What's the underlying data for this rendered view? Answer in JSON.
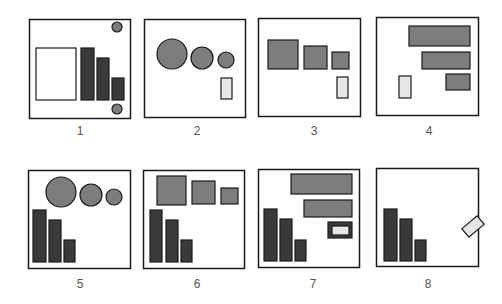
{
  "colors": {
    "stroke": "#1a1a1a",
    "dark": "#3a3a3a",
    "medium": "#7d7d7d",
    "light": "#e6e6e6",
    "white": "#ffffff"
  },
  "panels": [
    {
      "label": "1",
      "x": 29,
      "y": 19,
      "w": 101,
      "h": 99,
      "label_x": 80,
      "label_y": 124,
      "shapes": [
        {
          "type": "rect",
          "name": "white-rect",
          "x": 36,
          "y": 48,
          "w": 40,
          "h": 52,
          "fill": "white"
        },
        {
          "type": "rect",
          "name": "bar-1",
          "x": 81,
          "y": 48,
          "w": 13,
          "h": 52,
          "fill": "dark"
        },
        {
          "type": "rect",
          "name": "bar-2",
          "x": 97,
          "y": 58,
          "w": 12,
          "h": 42,
          "fill": "dark"
        },
        {
          "type": "rect",
          "name": "bar-3",
          "x": 112,
          "y": 78,
          "w": 12,
          "h": 22,
          "fill": "dark"
        },
        {
          "type": "circle",
          "name": "circle-top",
          "cx": 117,
          "cy": 27,
          "r": 5,
          "fill": "medium"
        },
        {
          "type": "circle",
          "name": "circle-bottom",
          "cx": 117,
          "cy": 109,
          "r": 5,
          "fill": "medium"
        }
      ]
    },
    {
      "label": "2",
      "x": 144,
      "y": 19,
      "w": 101,
      "h": 98,
      "label_x": 197,
      "label_y": 124,
      "shapes": [
        {
          "type": "circle",
          "name": "circle-large",
          "cx": 172,
          "cy": 54,
          "r": 15,
          "fill": "medium"
        },
        {
          "type": "circle",
          "name": "circle-medium",
          "cx": 202,
          "cy": 58,
          "r": 11,
          "fill": "medium"
        },
        {
          "type": "circle",
          "name": "circle-small",
          "cx": 226,
          "cy": 60,
          "r": 8,
          "fill": "medium"
        },
        {
          "type": "rect",
          "name": "light-rect",
          "x": 221,
          "y": 78,
          "w": 11,
          "h": 21,
          "fill": "light"
        }
      ]
    },
    {
      "label": "3",
      "x": 258,
      "y": 18,
      "w": 102,
      "h": 98,
      "label_x": 314,
      "label_y": 124,
      "shapes": [
        {
          "type": "rect",
          "name": "square-large",
          "x": 268,
          "y": 40,
          "w": 30,
          "h": 29,
          "fill": "medium"
        },
        {
          "type": "rect",
          "name": "square-medium",
          "x": 304,
          "y": 46,
          "w": 23,
          "h": 23,
          "fill": "medium"
        },
        {
          "type": "rect",
          "name": "square-small",
          "x": 332,
          "y": 52,
          "w": 17,
          "h": 17,
          "fill": "medium"
        },
        {
          "type": "rect",
          "name": "light-rect",
          "x": 337,
          "y": 77,
          "w": 11,
          "h": 21,
          "fill": "light"
        }
      ]
    },
    {
      "label": "4",
      "x": 376,
      "y": 17,
      "w": 102,
      "h": 98,
      "label_x": 429,
      "label_y": 124,
      "shapes": [
        {
          "type": "rect",
          "name": "hbar-1",
          "x": 409,
          "y": 26,
          "w": 61,
          "h": 20,
          "fill": "medium"
        },
        {
          "type": "rect",
          "name": "hbar-2",
          "x": 422,
          "y": 52,
          "w": 48,
          "h": 17,
          "fill": "medium"
        },
        {
          "type": "rect",
          "name": "hbar-3",
          "x": 446,
          "y": 74,
          "w": 24,
          "h": 16,
          "fill": "medium"
        },
        {
          "type": "rect",
          "name": "light-rect",
          "x": 399,
          "y": 76,
          "w": 12,
          "h": 22,
          "fill": "light"
        }
      ]
    },
    {
      "label": "5",
      "x": 28,
      "y": 170,
      "w": 102,
      "h": 98,
      "label_x": 80,
      "label_y": 277,
      "shapes": [
        {
          "type": "circle",
          "name": "circle-large",
          "cx": 61,
          "cy": 192,
          "r": 15,
          "fill": "medium"
        },
        {
          "type": "circle",
          "name": "circle-medium",
          "cx": 91,
          "cy": 195,
          "r": 11,
          "fill": "medium"
        },
        {
          "type": "circle",
          "name": "circle-small",
          "cx": 114,
          "cy": 197,
          "r": 8,
          "fill": "medium"
        },
        {
          "type": "rect",
          "name": "bar-1",
          "x": 33,
          "y": 210,
          "w": 13,
          "h": 52,
          "fill": "dark"
        },
        {
          "type": "rect",
          "name": "bar-2",
          "x": 49,
          "y": 220,
          "w": 12,
          "h": 42,
          "fill": "dark"
        },
        {
          "type": "rect",
          "name": "bar-3",
          "x": 64,
          "y": 240,
          "w": 11,
          "h": 22,
          "fill": "dark"
        }
      ]
    },
    {
      "label": "6",
      "x": 143,
      "y": 170,
      "w": 101,
      "h": 98,
      "label_x": 197,
      "label_y": 277,
      "shapes": [
        {
          "type": "rect",
          "name": "square-large",
          "x": 157,
          "y": 176,
          "w": 29,
          "h": 29,
          "fill": "medium"
        },
        {
          "type": "rect",
          "name": "square-medium",
          "x": 192,
          "y": 181,
          "w": 23,
          "h": 23,
          "fill": "medium"
        },
        {
          "type": "rect",
          "name": "square-small",
          "x": 221,
          "y": 188,
          "w": 17,
          "h": 16,
          "fill": "medium"
        },
        {
          "type": "rect",
          "name": "bar-1",
          "x": 150,
          "y": 210,
          "w": 12,
          "h": 52,
          "fill": "dark"
        },
        {
          "type": "rect",
          "name": "bar-2",
          "x": 166,
          "y": 220,
          "w": 12,
          "h": 42,
          "fill": "dark"
        },
        {
          "type": "rect",
          "name": "bar-3",
          "x": 181,
          "y": 240,
          "w": 11,
          "h": 22,
          "fill": "dark"
        }
      ]
    },
    {
      "label": "7",
      "x": 258,
      "y": 169,
      "w": 101,
      "h": 98,
      "label_x": 313,
      "label_y": 277,
      "shapes": [
        {
          "type": "rect",
          "name": "hbar-1",
          "x": 291,
          "y": 174,
          "w": 61,
          "h": 20,
          "fill": "medium"
        },
        {
          "type": "rect",
          "name": "hbar-2",
          "x": 304,
          "y": 200,
          "w": 48,
          "h": 17,
          "fill": "medium"
        },
        {
          "type": "rect",
          "name": "framed-light-rect-outer",
          "x": 328,
          "y": 222,
          "w": 24,
          "h": 16,
          "fill": "dark"
        },
        {
          "type": "rect",
          "name": "framed-light-rect-inner",
          "x": 332,
          "y": 226,
          "w": 17,
          "h": 9,
          "fill": "light"
        },
        {
          "type": "rect",
          "name": "bar-1",
          "x": 264,
          "y": 209,
          "w": 13,
          "h": 52,
          "fill": "dark"
        },
        {
          "type": "rect",
          "name": "bar-2",
          "x": 280,
          "y": 219,
          "w": 12,
          "h": 42,
          "fill": "dark"
        },
        {
          "type": "rect",
          "name": "bar-3",
          "x": 295,
          "y": 240,
          "w": 11,
          "h": 21,
          "fill": "dark"
        }
      ]
    },
    {
      "label": "8",
      "x": 376,
      "y": 168,
      "w": 102,
      "h": 98,
      "label_x": 428,
      "label_y": 277,
      "shapes": [
        {
          "type": "rect",
          "name": "bar-1",
          "x": 384,
          "y": 209,
          "w": 13,
          "h": 52,
          "fill": "dark"
        },
        {
          "type": "rect",
          "name": "bar-2",
          "x": 400,
          "y": 219,
          "w": 12,
          "h": 42,
          "fill": "dark"
        },
        {
          "type": "rect",
          "name": "bar-3",
          "x": 415,
          "y": 240,
          "w": 11,
          "h": 21,
          "fill": "dark"
        },
        {
          "type": "rect",
          "name": "rotated-light-rect",
          "x": 463,
          "y": 221,
          "w": 20,
          "h": 11,
          "fill": "light",
          "rotate": -40
        }
      ]
    }
  ]
}
